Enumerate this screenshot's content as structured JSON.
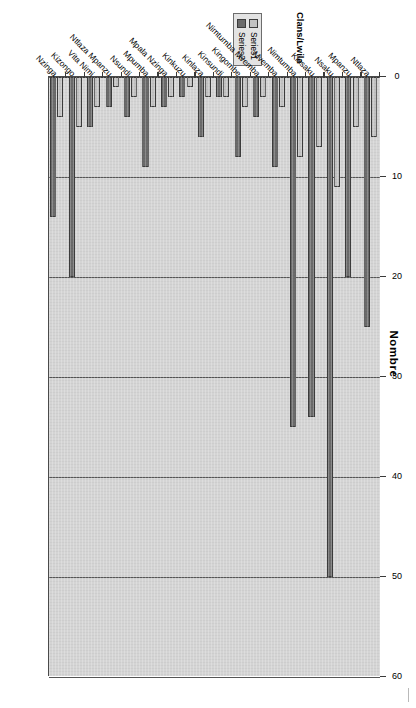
{
  "figure": {
    "title": "Nombre",
    "axis_title": "Clans/Lwila",
    "orientation": "rotated-90"
  },
  "legend": {
    "items": [
      {
        "label": "Series1",
        "color": "#c2c2c2"
      },
      {
        "label": "Series2",
        "color": "#6b6b6b"
      }
    ]
  },
  "chart_data": {
    "type": "bar",
    "title": "Nombre",
    "xlabel": "Nombre",
    "ylabel": "Clans/Lwila",
    "orientation": "horizontal",
    "xlim": [
      0,
      60
    ],
    "xticks": [
      0,
      10,
      20,
      30,
      40,
      50,
      60
    ],
    "grid": true,
    "legend_position": "left",
    "categories": [
      "Ntlaza",
      "Mpanzu",
      "Nsaku",
      "Kinsaku",
      "Nimtumba",
      "Mvemba",
      "Nimtumba Mvemba",
      "Kingombe",
      "Kinsundi",
      "Kinlaza",
      "Kinkuzu",
      "Mpala Nzinga",
      "Mpumba",
      "Nsundi",
      "Ntlaza Mpanzu",
      "Vita Nimi",
      "Kizongo",
      "Nzinga"
    ],
    "series": [
      {
        "name": "Series1",
        "color": "#c2c2c2",
        "values": [
          6,
          5,
          11,
          7,
          8,
          3,
          2,
          3,
          2,
          2,
          1,
          2,
          3,
          2,
          1,
          3,
          5,
          4
        ]
      },
      {
        "name": "Series2",
        "color": "#6b6b6b",
        "values": [
          25,
          20,
          50,
          34,
          35,
          9,
          4,
          8,
          2,
          6,
          2,
          3,
          9,
          4,
          3,
          5,
          20,
          14
        ]
      }
    ]
  }
}
